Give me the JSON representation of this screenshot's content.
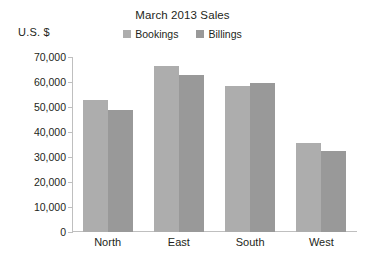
{
  "chart_data": {
    "type": "bar",
    "title": "March 2013 Sales",
    "xlabel": "",
    "ylabel": "U.S. $",
    "categories": [
      "North",
      "East",
      "South",
      "West"
    ],
    "series": [
      {
        "name": "Bookings",
        "color": "#adadad",
        "values": [
          53000,
          66500,
          58500,
          35500
        ]
      },
      {
        "name": "Billings",
        "color": "#999999",
        "values": [
          49000,
          63000,
          59500,
          32500
        ]
      }
    ],
    "ylim": [
      0,
      70000
    ],
    "ytick_step": 10000,
    "ytick_labels": [
      "70,000",
      "60,000",
      "50,000",
      "40,000",
      "30,000",
      "20,000",
      "10,000",
      "0"
    ],
    "ytick_values": [
      70000,
      60000,
      50000,
      40000,
      30000,
      20000,
      10000,
      0
    ],
    "grid": false,
    "legend_position": "top-center"
  }
}
